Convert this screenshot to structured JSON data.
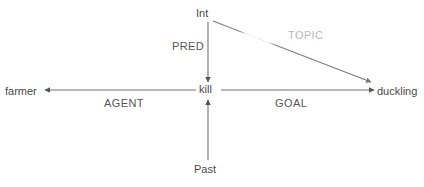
{
  "diagram": {
    "type": "semantic-dependency-graph",
    "background_color": "#ffffff",
    "line_color": "#707070",
    "text_color": "#4a4a4a",
    "faded_text_color": "#b8b8b8",
    "nodes": [
      {
        "id": "int",
        "label": "Int",
        "x": 208,
        "y": 13
      },
      {
        "id": "kill",
        "label": "kill",
        "x": 208,
        "y": 90
      },
      {
        "id": "farmer",
        "label": "farmer",
        "x": 22,
        "y": 91
      },
      {
        "id": "duckling",
        "label": "duckling",
        "x": 398,
        "y": 91
      },
      {
        "id": "past",
        "label": "Past",
        "x": 206,
        "y": 169
      }
    ],
    "edges": [
      {
        "id": "pred",
        "label": "PRED",
        "from": "int",
        "to": "kill",
        "faded": false
      },
      {
        "id": "agent",
        "label": "AGENT",
        "from": "kill",
        "to": "farmer",
        "faded": false
      },
      {
        "id": "goal",
        "label": "GOAL",
        "from": "kill",
        "to": "duckling",
        "faded": false
      },
      {
        "id": "topic",
        "label": "TOPIC",
        "from": "int",
        "to": "duckling",
        "faded": true
      },
      {
        "id": "tense",
        "label": "",
        "from": "past",
        "to": "kill",
        "faded": false
      }
    ]
  }
}
